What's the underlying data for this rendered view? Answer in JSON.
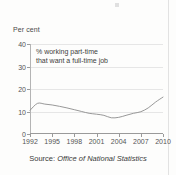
{
  "figure": {
    "y_axis_title": "Per cent",
    "annotation_line1": "% working part-time",
    "annotation_line2": "that want a full-time job",
    "source_prefix": "Source:",
    "source_org": "Office of National Statistics"
  },
  "colors": {
    "line": "#8c8c8c",
    "grid": "#e6e6e6",
    "axis": "#9a9a9a",
    "text": "#4a4a4a",
    "background": "#fdfdfc"
  },
  "chart_data": {
    "type": "line",
    "title": "",
    "subtitle": "",
    "xlabel": "",
    "ylabel": "Per cent",
    "xlim": [
      1992,
      2010
    ],
    "ylim": [
      0,
      40
    ],
    "grid": true,
    "legend": false,
    "ytick_labels": [
      "0",
      "10",
      "20",
      "30",
      "40"
    ],
    "ytick_values": [
      0,
      10,
      20,
      30,
      40
    ],
    "xtick_labels": [
      "1992",
      "1995",
      "1998",
      "2001",
      "2004",
      "2007",
      "2010"
    ],
    "xtick_values": [
      1992,
      1995,
      1998,
      2001,
      2004,
      2007,
      2010
    ],
    "annotations": [
      "% working part-time",
      "that want a full-time job"
    ],
    "source": "Source: Office of National Statistics",
    "series": [
      {
        "name": "% working part-time that want a full-time job",
        "x": [
          1992,
          1993,
          1994,
          1995,
          1996,
          1997,
          1998,
          1999,
          2000,
          2001,
          2002,
          2003,
          2004,
          2005,
          2006,
          2007,
          2008,
          2009,
          2010
        ],
        "values": [
          10.5,
          13.6,
          13.3,
          12.9,
          12.3,
          11.6,
          10.8,
          10.0,
          9.2,
          8.8,
          8.3,
          7.2,
          7.4,
          8.3,
          9.2,
          9.9,
          11.6,
          14.2,
          16.4
        ]
      }
    ]
  }
}
